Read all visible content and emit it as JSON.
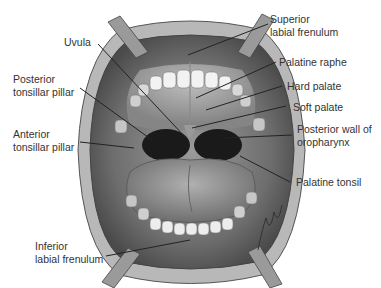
{
  "figure": {
    "signature": "Christopher M. Smith"
  },
  "labels": {
    "uvula": "Uvula",
    "posterior_tonsillar_pillar_1": "Posterior",
    "posterior_tonsillar_pillar_2": "tonsillar pillar",
    "anterior_tonsillar_pillar_1": "Anterior",
    "anterior_tonsillar_pillar_2": "tonsillar pillar",
    "inferior_labial_frenulum_1": "Inferior",
    "inferior_labial_frenulum_2": "labial frenulum",
    "superior_labial_frenulum_1": "Superior",
    "superior_labial_frenulum_2": "labial frenulum",
    "palatine_raphe": "Palatine raphe",
    "hard_palate": "Hard palate",
    "soft_palate": "Soft palate",
    "posterior_wall_1": "Posterior wall of",
    "posterior_wall_2": "oropharynx",
    "palatine_tonsil": "Palatine tonsil"
  },
  "colors": {
    "text": "#333333",
    "leader": "#222222",
    "tissue_dark": "#5a5a5a",
    "tissue_mid": "#8a8a8a",
    "tissue_light": "#bdbdbd",
    "teeth": "#f2f2f2",
    "pharynx": "#1a1a1a"
  }
}
